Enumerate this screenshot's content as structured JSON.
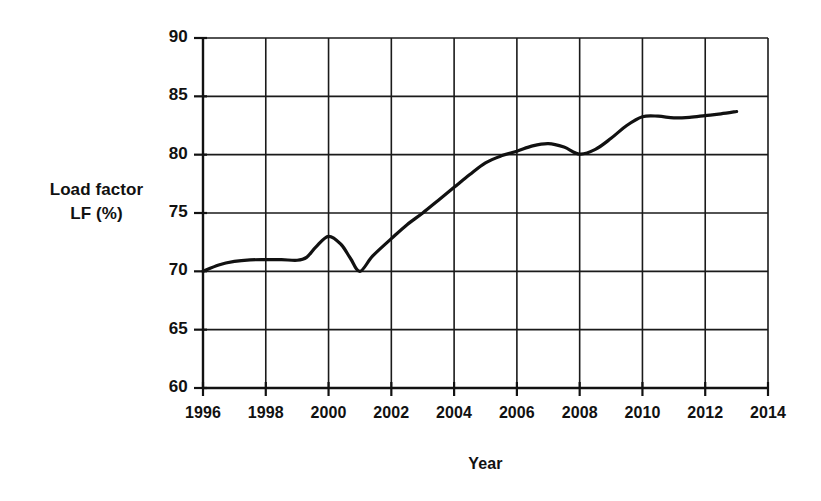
{
  "chart_data": {
    "type": "line",
    "title": "",
    "xlabel": "Year",
    "ylabel": "Load factor LF (%)",
    "ylabel_line1": "Load factor",
    "ylabel_line2": "LF (%)",
    "xlim": [
      1996,
      2014
    ],
    "ylim": [
      60,
      90
    ],
    "grid": true,
    "legend": "none",
    "x_tick_labels": [
      "1996",
      "1998",
      "2000",
      "2002",
      "2004",
      "2006",
      "2008",
      "2010",
      "2012",
      "2014"
    ],
    "x_ticks": [
      1996,
      1998,
      2000,
      2002,
      2004,
      2006,
      2008,
      2010,
      2012,
      2014
    ],
    "y_tick_labels": [
      "90",
      "85",
      "80",
      "75",
      "70",
      "65",
      "60"
    ],
    "y_ticks": [
      90,
      85,
      80,
      75,
      70,
      65,
      60
    ],
    "x_grid_step": 2,
    "y_grid_step": 5,
    "series": [
      {
        "name": "Load factor",
        "color": "#111111",
        "line_width": 3.2,
        "x": [
          1996,
          1996.5,
          1997,
          1997.5,
          1998,
          1998.5,
          1999,
          1999.3,
          1999.6,
          2000,
          2000.4,
          2000.7,
          2001,
          2001.4,
          2002,
          2002.5,
          2003,
          2003.5,
          2004,
          2004.5,
          2005,
          2005.5,
          2006,
          2006.5,
          2007,
          2007.5,
          2008,
          2008.5,
          2009,
          2009.5,
          2010,
          2010.5,
          2011,
          2011.5,
          2012,
          2012.5,
          2013
        ],
        "y": [
          70.0,
          70.55,
          70.85,
          70.98,
          71.0,
          71.0,
          70.95,
          71.2,
          72.1,
          73.0,
          72.3,
          71.1,
          70.0,
          71.3,
          72.8,
          74.0,
          75.0,
          76.1,
          77.2,
          78.3,
          79.3,
          79.9,
          80.3,
          80.75,
          80.95,
          80.65,
          80.05,
          80.45,
          81.4,
          82.5,
          83.25,
          83.3,
          83.15,
          83.2,
          83.35,
          83.5,
          83.7
        ]
      }
    ],
    "annotations": {
      "start_value": 70.0,
      "peak_2000": 73.0,
      "trough_2001": 70.0,
      "value_2006": 80.3,
      "peak_2007": 81.0,
      "value_2008": 80.0,
      "plateau_2010": 83.3,
      "end_value": 83.7
    }
  }
}
